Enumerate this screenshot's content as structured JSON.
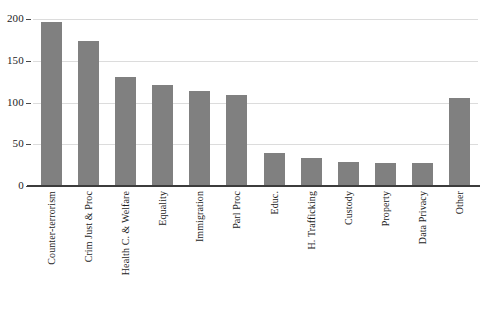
{
  "chart_data": {
    "type": "bar",
    "title": "",
    "xlabel": "",
    "ylabel": "",
    "ylim": [
      0,
      200
    ],
    "yticks": [
      "0",
      "50",
      "100",
      "150",
      "200"
    ],
    "grid": true,
    "legend": "none",
    "bar_color": "#808080",
    "gridline_color": "#dcdcdc",
    "axis_color": "#3c3c3c",
    "categories": [
      "Counter-terrorism",
      "Crim Just & Proc",
      "Health C. & Welfare",
      "Equality",
      "Immigration",
      "Parl Proc",
      "Educ.",
      "H. Trafficking",
      "Custody",
      "Property",
      "Data Privacy",
      "Other"
    ],
    "values": [
      197,
      174,
      130,
      121,
      114,
      109,
      40,
      34,
      29,
      28,
      27,
      105
    ]
  },
  "caption": {
    "text": ""
  }
}
